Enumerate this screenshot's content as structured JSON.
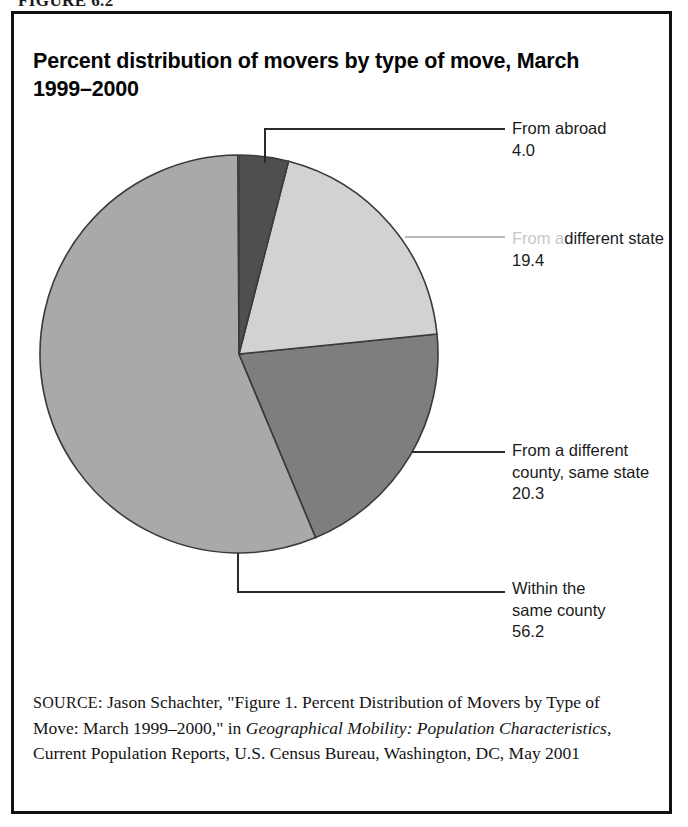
{
  "figure": {
    "caption": "FIGURE 6.2"
  },
  "chart": {
    "title": "Percent distribution of movers by type of move, March 1999–2000"
  },
  "chart_data": {
    "type": "pie",
    "title": "Percent distribution of movers by type of move, March 1999–2000",
    "unit": "percent",
    "start_angle_deg": 0,
    "direction": "clockwise",
    "categories": [
      "From abroad",
      "From a different state",
      "From a different county, same state",
      "Within the same county"
    ],
    "values": [
      4.0,
      19.4,
      20.3,
      56.2
    ],
    "total": 99.9,
    "colors": [
      "#4f4f4f",
      "#d2d2d2",
      "#7e7e7e",
      "#a9a9a9"
    ],
    "legend": "none",
    "grid": false,
    "slices": [
      {
        "name": "From abroad",
        "value": 4.0,
        "value_text": "4.0",
        "label_lines": [
          "From abroad",
          "4.0"
        ],
        "color": "#4f4f4f",
        "start_deg": 0,
        "end_deg": 14.4
      },
      {
        "name": "From a different state",
        "value": 19.4,
        "value_text": "19.4",
        "label_lines": [
          "From a",
          "different state",
          "19.4"
        ],
        "color": "#d2d2d2",
        "start_deg": 14.4,
        "end_deg": 84.24
      },
      {
        "name": "From a different county, same state",
        "value": 20.3,
        "value_text": "20.3",
        "label_lines": [
          "From a different",
          "county, same state",
          "20.3"
        ],
        "color": "#7e7e7e",
        "start_deg": 84.24,
        "end_deg": 157.32
      },
      {
        "name": "Within the same county",
        "value": 56.2,
        "value_text": "56.2",
        "label_lines": [
          "Within the",
          "same county",
          "56.2"
        ],
        "color": "#a9a9a9",
        "start_deg": 157.32,
        "end_deg": 359.64
      }
    ]
  },
  "labels": {
    "abroad": "From abroad\n4.0",
    "state_line1": "From a",
    "state_rest": "different state\n19.4",
    "county": "From a different\ncounty, same state\n20.3",
    "within": "Within the\nsame county\n56.2"
  },
  "source": {
    "kicker": "SOURCE:",
    "text_1": " Jason Schachter, \"Figure 1. Percent Distribution of Movers by Type of Move: March 1999–2000,\" in ",
    "italic_1": "Geographical Mobility: Population Characteristics,",
    "text_2": " Current Population Reports, U.S. Census Bureau, Washington, DC, May 2001"
  },
  "colors": {
    "frame": "#111111",
    "ink": "#141414",
    "leader": "#2a2a2a",
    "slice_abroad": "#4f4f4f",
    "slice_state": "#d2d2d2",
    "slice_county": "#7e7e7e",
    "slice_within": "#a9a9a9"
  }
}
